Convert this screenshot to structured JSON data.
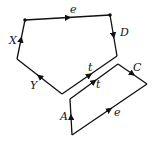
{
  "diagram": {
    "type": "graph-loops",
    "upper_loop": {
      "vertices": [
        [
          25,
          20
        ],
        [
          110,
          15
        ],
        [
          117,
          56
        ],
        [
          62,
          94
        ],
        [
          17,
          59
        ]
      ],
      "edge_labels": [
        {
          "text": "e",
          "x": 70,
          "y": 13
        },
        {
          "text": "D",
          "x": 120,
          "y": 36
        },
        {
          "text": "t",
          "x": 88,
          "y": 71
        },
        {
          "text": "Y",
          "x": 30,
          "y": 89
        },
        {
          "text": "X",
          "x": 9,
          "y": 44
        }
      ]
    },
    "lower_loop": {
      "vertices": [
        [
          70,
          99
        ],
        [
          118,
          64
        ],
        [
          147,
          84
        ],
        [
          72,
          135
        ]
      ],
      "edge_labels": [
        {
          "text": "t",
          "x": 96,
          "y": 88
        },
        {
          "text": "C",
          "x": 133,
          "y": 71
        },
        {
          "text": "e",
          "x": 114,
          "y": 116
        },
        {
          "text": "A",
          "x": 60,
          "y": 120
        }
      ]
    },
    "stroke_color": "#111111"
  }
}
